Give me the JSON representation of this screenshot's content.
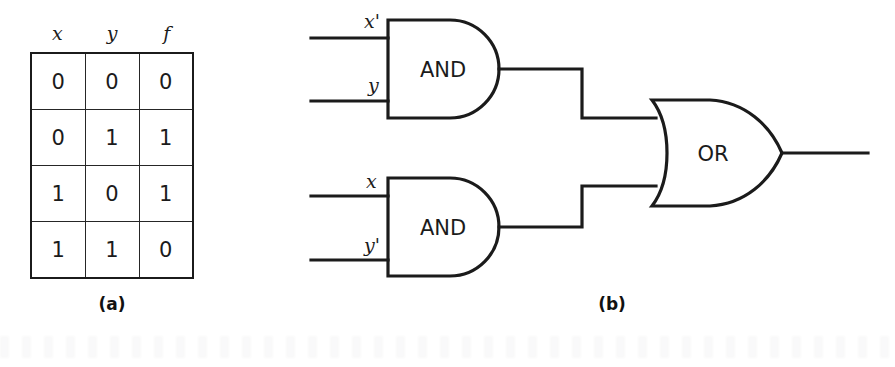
{
  "figure": {
    "background_color": "#ffffff",
    "line_color": "#1b1b1b"
  },
  "truth_table": {
    "headers": [
      "x",
      "y",
      "f"
    ],
    "rows": [
      [
        "0",
        "0",
        "0"
      ],
      [
        "0",
        "1",
        "1"
      ],
      [
        "1",
        "0",
        "1"
      ],
      [
        "1",
        "1",
        "0"
      ]
    ],
    "caption": "(a)"
  },
  "circuit": {
    "caption": "(b)",
    "gates": [
      {
        "id": "and-gate-top",
        "type": "AND",
        "label": "AND",
        "inputs": [
          "x'",
          "y"
        ]
      },
      {
        "id": "and-gate-bottom",
        "type": "AND",
        "label": "AND",
        "inputs": [
          "x",
          "y'"
        ]
      },
      {
        "id": "or-gate",
        "type": "OR",
        "label": "OR",
        "inputs": [
          "and-gate-top",
          "and-gate-bottom"
        ]
      }
    ],
    "input_labels": {
      "top_gate_input_1": "x'",
      "top_gate_input_2": "y",
      "bottom_gate_input_1": "x",
      "bottom_gate_input_2": "y'"
    }
  }
}
